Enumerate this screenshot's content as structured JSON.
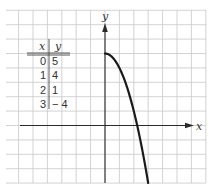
{
  "chart_data": {
    "type": "line",
    "title": "",
    "xlabel": "x",
    "ylabel": "y",
    "grid": true,
    "xlim": [
      -7,
      7
    ],
    "ylim": [
      -4,
      8
    ],
    "table": {
      "headers": [
        "x",
        "y"
      ],
      "rows": [
        [
          "0",
          "5"
        ],
        [
          "1",
          "4"
        ],
        [
          "2",
          "1"
        ],
        [
          "3",
          "− 4"
        ]
      ]
    },
    "series": [
      {
        "name": "curve",
        "x": [
          0,
          1,
          2,
          3
        ],
        "y": [
          5,
          4,
          1,
          -4
        ]
      }
    ]
  }
}
